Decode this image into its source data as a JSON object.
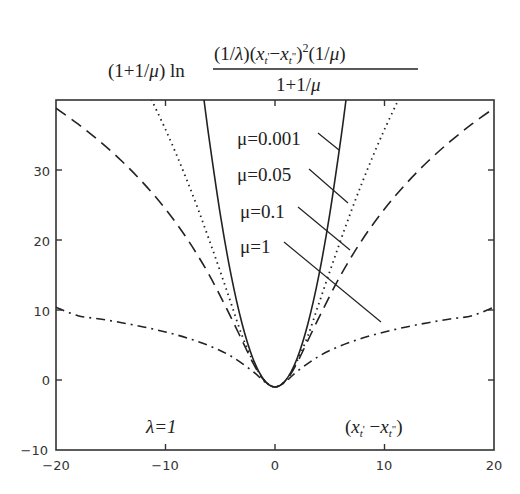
{
  "chart_data": {
    "type": "line",
    "title_parts": {
      "prefix": "(1+1/",
      "mu": "μ",
      "prefix_close": ") ln",
      "numerator": "(1/λ)(x",
      "numerator_full": "(1/λ)(x_t' − x_t'')²(1/μ)",
      "denominator": "1+1/μ"
    },
    "xlabel": "(x_t' − x_t'')",
    "ylabel": "",
    "xlim": [
      -20,
      20
    ],
    "ylim": [
      -10,
      40
    ],
    "x_ticks": [
      "-20",
      "-10",
      "0",
      "10",
      "20"
    ],
    "y_ticks": [
      "-10",
      "0",
      "10",
      "20",
      "30"
    ],
    "grid": false,
    "legend_position": "inline labels with leader lines",
    "annotations": [
      "λ=1",
      "(x_t' − x_t'')"
    ],
    "series": [
      {
        "name": "μ=0.001",
        "style": "solid",
        "x": [
          0,
          1,
          2,
          3,
          4,
          5,
          6,
          6.4,
          6.5
        ],
        "values": [
          -1,
          0,
          3,
          8,
          14.9,
          23.7,
          34.3,
          39,
          40.2
        ]
      },
      {
        "name": "μ=0.05",
        "style": "dotted",
        "x": [
          0,
          1,
          2,
          3,
          4,
          5,
          6,
          7,
          8,
          9,
          10,
          11,
          11.3
        ],
        "values": [
          -1,
          -0.02,
          2.66,
          6.3,
          10.89,
          15.5,
          19.97,
          24.3,
          28.36,
          32.2,
          35.79,
          39.14,
          40.1
        ]
      },
      {
        "name": "μ=0.1",
        "style": "dashed",
        "x": [
          0,
          1,
          2,
          4,
          6,
          8,
          10,
          12,
          14,
          16,
          18,
          20
        ],
        "values": [
          -1,
          -0.04,
          2.41,
          8.88,
          14.98,
          20.11,
          24.42,
          28.09,
          31.28,
          34.08,
          36.58,
          38.83
        ]
      },
      {
        "name": "μ=1",
        "style": "dash-dot",
        "x": [
          0,
          1,
          2,
          4,
          6,
          8,
          10,
          12,
          14,
          16,
          18,
          20
        ],
        "values": [
          -1,
          -0.19,
          1.2,
          3.39,
          4.89,
          5.99,
          6.86,
          7.58,
          8.19,
          8.72,
          9.19,
          10.4
        ]
      }
    ],
    "symmetric_about_x0": true
  },
  "labels": {
    "mu001": "μ=0.001",
    "mu005": "μ=0.05",
    "mu01": "μ=0.1",
    "mu1": "μ=1",
    "lambda": "λ=1",
    "xaxis": "(x",
    "tick_x": [
      "−20",
      "−10",
      "0",
      "10",
      "20"
    ],
    "tick_y": [
      "30",
      "20",
      "10",
      "0",
      "−10"
    ]
  },
  "colors": {
    "line": "#222222",
    "axis": "#333333",
    "background": "#ffffff"
  }
}
